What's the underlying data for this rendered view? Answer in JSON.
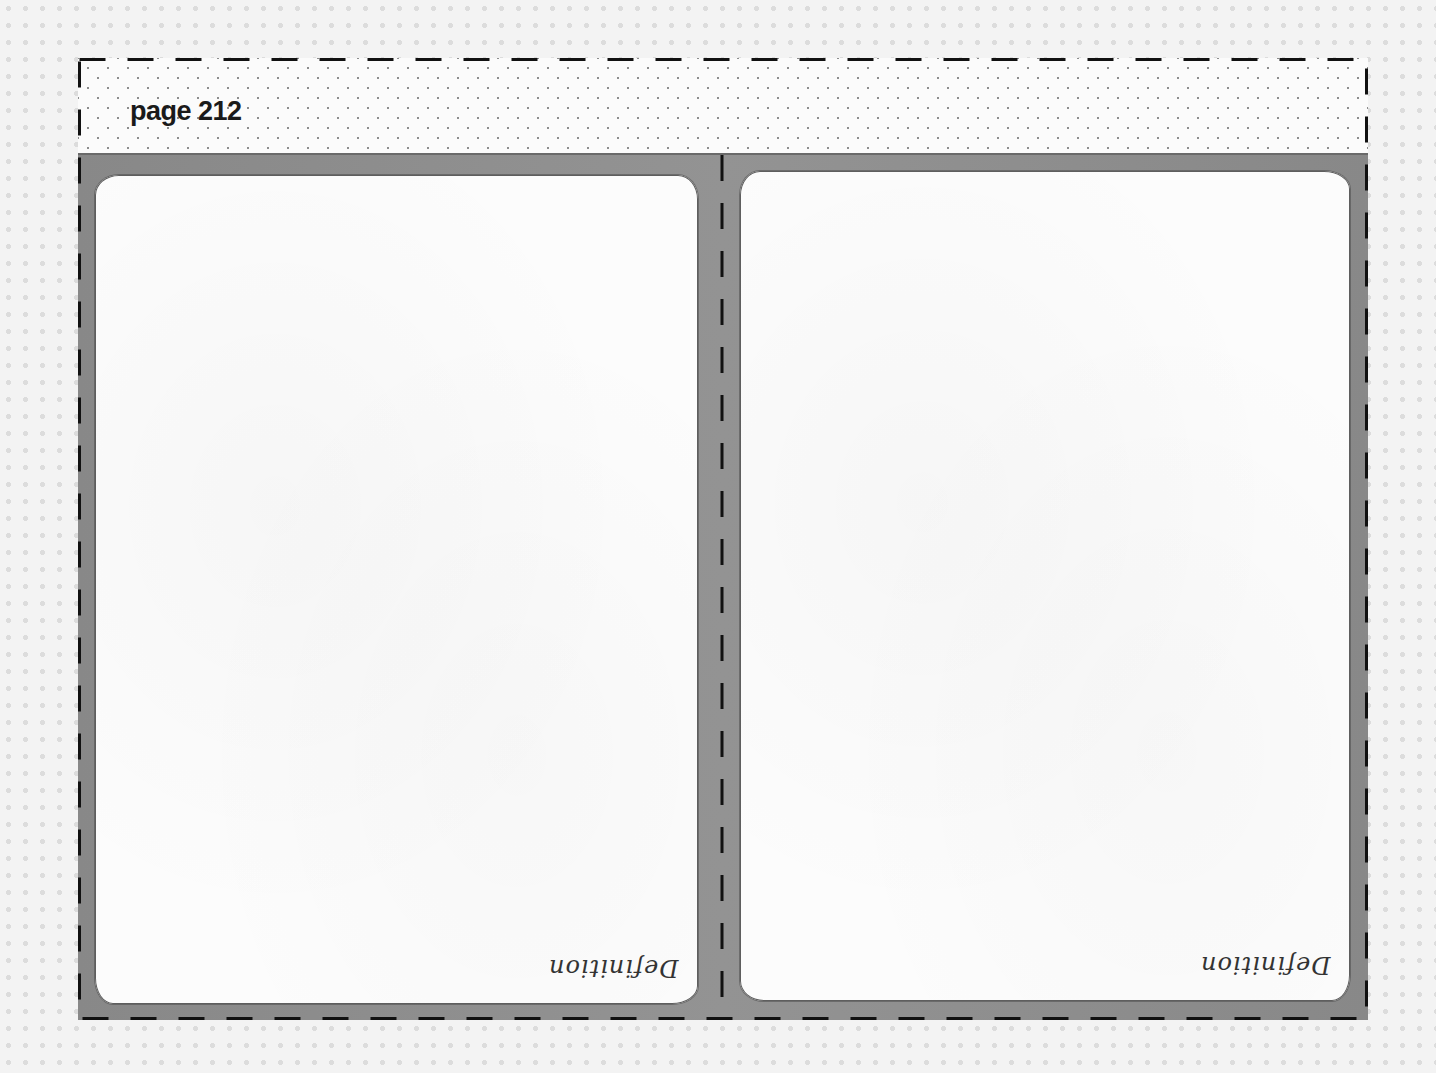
{
  "sheet": {
    "page_label": "page 212",
    "cards": [
      {
        "label": "Definition",
        "content": ""
      },
      {
        "label": "Definition",
        "content": ""
      }
    ]
  },
  "colors": {
    "background": "#f3f3f3",
    "panel_gray": "#8c8c8c",
    "card_fill": "#fcfcfc",
    "cut_line": "#111111",
    "text": "#1a1a1a"
  },
  "icons": {
    "cut_line": "dashed-cut-line"
  }
}
